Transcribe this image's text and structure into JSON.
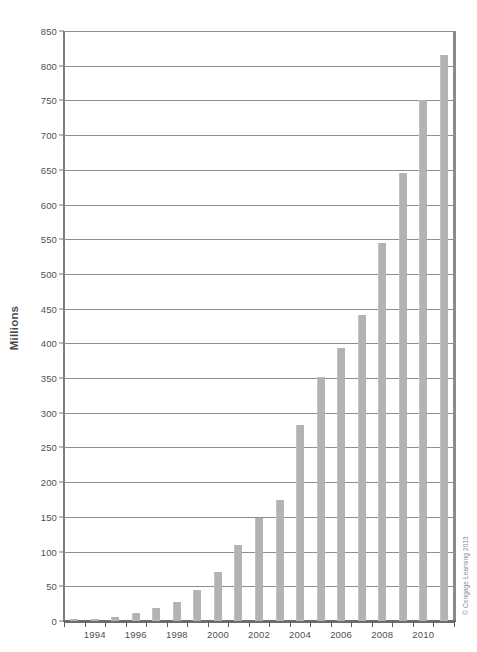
{
  "chart_data": {
    "type": "bar",
    "title": "",
    "xlabel": "",
    "ylabel": "Millions",
    "ylim": [
      0,
      850
    ],
    "ytick_step": 50,
    "grid": true,
    "legend": null,
    "bar_color": "#b3b3b3",
    "gridline_color": "#8e8e8e",
    "axis_color": "#6d6d6d",
    "categories": [
      "1993",
      "1994",
      "1995",
      "1996",
      "1997",
      "1998",
      "1999",
      "2000",
      "2001",
      "2002",
      "2003",
      "2004",
      "2005",
      "2006",
      "2007",
      "2008",
      "2009",
      "2010",
      "2011"
    ],
    "values": [
      3,
      3,
      6,
      12,
      19,
      28,
      45,
      70,
      110,
      148,
      174,
      282,
      351,
      393,
      441,
      545,
      645,
      750,
      815
    ],
    "ytick_labels": [
      "0",
      "50",
      "100",
      "150",
      "200",
      "250",
      "300",
      "350",
      "400",
      "450",
      "500",
      "550",
      "600",
      "650",
      "700",
      "750",
      "800",
      "850"
    ],
    "ytick_values": [
      0,
      50,
      100,
      150,
      200,
      250,
      300,
      350,
      400,
      450,
      500,
      550,
      600,
      650,
      700,
      750,
      800,
      850
    ],
    "xtick_labels": [
      "1994",
      "1996",
      "1998",
      "2000",
      "2002",
      "2004",
      "2006",
      "2008",
      "2010"
    ],
    "xtick_label_categories": [
      "1994",
      "1996",
      "1998",
      "2000",
      "2002",
      "2004",
      "2006",
      "2008",
      "2010"
    ]
  },
  "credit": {
    "text": "© Cengage Learning 2013"
  }
}
